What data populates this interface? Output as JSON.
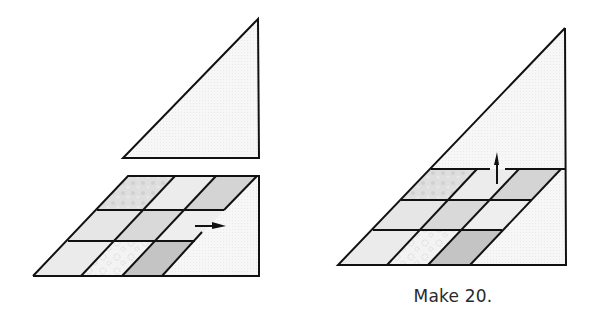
{
  "figure": {
    "left_step": {
      "pieces": [
        "setting-triangle",
        "patch-unit-3x3"
      ],
      "arrow_direction": "right",
      "note": "Triangle shown separated above the pieced unit"
    },
    "right_step": {
      "pieces": [
        "assembled-triangle"
      ],
      "arrow_direction": "up"
    },
    "caption": "Make 20.",
    "fabric_colors": {
      "outline": "#111111",
      "background": "#f6f6f6",
      "light_print": "#e4e4e4",
      "medium_print": "#d6d6d6",
      "dark_print": "#c2c2c2",
      "white_print": "#f2f2f2"
    }
  }
}
